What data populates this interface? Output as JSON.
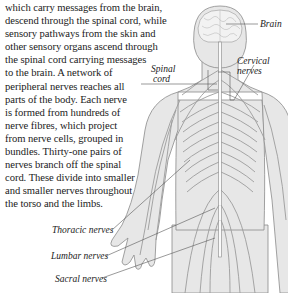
{
  "article": {
    "lines": [
      "which carry messages from the brain,",
      "descend through the spinal cord, while",
      "sensory pathways from the skin and",
      "other sensory organs ascend through",
      "the spinal cord carrying messages",
      "to the brain. A network of",
      "peripheral nerves reaches all",
      "parts of the body. Each nerve",
      "is formed from hundreds of",
      "nerve fibres, which project",
      "from nerve cells, grouped in",
      "bundles. Thirty-one pairs of",
      "nerves branch off the spinal",
      "cord. These divide into smaller",
      "and smaller nerves throughout",
      "the torso and the limbs."
    ]
  },
  "figure": {
    "labels": {
      "brain": "Brain",
      "spinal_cord_1": "Spinal",
      "spinal_cord_2": "cord",
      "cervical_1": "Cervical",
      "cervical_2": "nerves",
      "thoracic": "Thoracic nerves",
      "lumbar": "Lumbar nerves",
      "sacral": "Sacral nerves"
    },
    "colors": {
      "body_fill": "#e6e6e6",
      "outline": "#8a8a8a",
      "nerve": "#9a9a9a",
      "leader": "#555555"
    }
  }
}
